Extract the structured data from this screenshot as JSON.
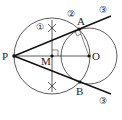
{
  "diagram": {
    "points": {
      "P": {
        "label": "P",
        "x": 14,
        "y": 56
      },
      "M": {
        "label": "M",
        "x": 52,
        "y": 56
      },
      "O": {
        "label": "O",
        "x": 89,
        "y": 56
      },
      "A": {
        "label": "A",
        "x": 79,
        "y": 29
      },
      "B": {
        "label": "B",
        "x": 80,
        "y": 82
      }
    },
    "steps": {
      "step1": "①",
      "step2": "②",
      "step3_top": "③",
      "step3_bottom": "③"
    },
    "circles": [
      {
        "name": "circle-M",
        "cx": 52,
        "cy": 56,
        "r": 38
      },
      {
        "name": "circle-O",
        "cx": 89,
        "cy": 56,
        "r": 28
      }
    ],
    "colors": {
      "stroke": "#222222",
      "background": "#ffffff"
    }
  }
}
